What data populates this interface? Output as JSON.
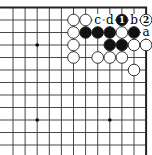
{
  "diagram": {
    "type": "go-board-corner",
    "corner": "top-right",
    "grid": {
      "cols": 12,
      "rows": 12,
      "x0": 13,
      "y0": 7.5,
      "dx": 12.1,
      "dy": 12.5,
      "edge_top": true,
      "edge_right": true
    },
    "star_points": [
      {
        "col": 2,
        "row": 3
      },
      {
        "col": 2,
        "row": 9
      },
      {
        "col": 8,
        "row": 9
      }
    ],
    "stones": [
      {
        "col": 5,
        "row": 1,
        "color": "white"
      },
      {
        "col": 6,
        "row": 1,
        "color": "white"
      },
      {
        "col": 9,
        "row": 1,
        "color": "black",
        "number": "1"
      },
      {
        "col": 11,
        "row": 1,
        "color": "white",
        "number": "2"
      },
      {
        "col": 5,
        "row": 2,
        "color": "white"
      },
      {
        "col": 6,
        "row": 2,
        "color": "black"
      },
      {
        "col": 7,
        "row": 2,
        "color": "black"
      },
      {
        "col": 8,
        "row": 2,
        "color": "black"
      },
      {
        "col": 9,
        "row": 2,
        "color": "white"
      },
      {
        "col": 10,
        "row": 2,
        "color": "black"
      },
      {
        "col": 5,
        "row": 3,
        "color": "white"
      },
      {
        "col": 8,
        "row": 3,
        "color": "black"
      },
      {
        "col": 9,
        "row": 3,
        "color": "black"
      },
      {
        "col": 10,
        "row": 3,
        "color": "white"
      },
      {
        "col": 11,
        "row": 3,
        "color": "white"
      },
      {
        "col": 5,
        "row": 4,
        "color": "white"
      },
      {
        "col": 7,
        "row": 4,
        "color": "white"
      },
      {
        "col": 8,
        "row": 4,
        "color": "white"
      },
      {
        "col": 9,
        "row": 4,
        "color": "white"
      },
      {
        "col": 10,
        "row": 5,
        "color": "white"
      }
    ],
    "letters": [
      {
        "col": 7,
        "row": 1,
        "text": "c"
      },
      {
        "col": 8,
        "row": 1,
        "text": "d"
      },
      {
        "col": 10,
        "row": 1,
        "text": "b"
      },
      {
        "col": 11,
        "row": 2,
        "text": "a"
      }
    ],
    "colors": {
      "line": "#333333",
      "edge": "#222222",
      "black_stone": "#111111",
      "white_stone": "#ffffff",
      "stone_outline": "#222222",
      "background": "#ffffff"
    }
  }
}
